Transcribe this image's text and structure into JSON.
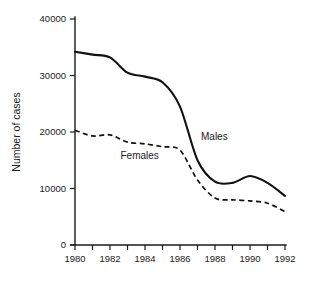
{
  "chart_data": {
    "type": "line",
    "title": "",
    "xlabel": "",
    "ylabel": "Number of cases",
    "x": [
      1980,
      1981,
      1982,
      1983,
      1984,
      1985,
      1986,
      1987,
      1988,
      1989,
      1990,
      1991,
      1992
    ],
    "xlim": [
      1980,
      1992
    ],
    "ylim": [
      0,
      40000
    ],
    "grid": false,
    "legend_position": "inline-annotation",
    "x_tick_values": [
      1980,
      1981,
      1982,
      1983,
      1984,
      1985,
      1986,
      1987,
      1988,
      1989,
      1990,
      1991,
      1992
    ],
    "x_tick_labels": [
      "1980",
      "",
      "1982",
      "",
      "1984",
      "",
      "1986",
      "",
      "1988",
      "",
      "1990",
      "",
      "1992"
    ],
    "y_tick_values": [
      0,
      10000,
      20000,
      30000,
      40000
    ],
    "y_tick_labels": [
      "0",
      "10000",
      "20000",
      "30000",
      "40000"
    ],
    "series": [
      {
        "name": "Males",
        "style": "solid",
        "color": "#111111",
        "label_text": "Males",
        "values": [
          34200,
          33700,
          33200,
          30500,
          29800,
          28800,
          24500,
          15000,
          11200,
          11000,
          12200,
          11000,
          8700
        ]
      },
      {
        "name": "Females",
        "style": "dashed",
        "color": "#111111",
        "label_text": "Females",
        "values": [
          20300,
          19300,
          19500,
          18200,
          17900,
          17400,
          16800,
          11500,
          8300,
          8000,
          7800,
          7400,
          5900
        ]
      }
    ],
    "annotations": [
      {
        "text": "Males",
        "x": 1987.2,
        "y": 18600
      },
      {
        "text": "Females",
        "x": 1982.6,
        "y": 15200
      }
    ]
  }
}
